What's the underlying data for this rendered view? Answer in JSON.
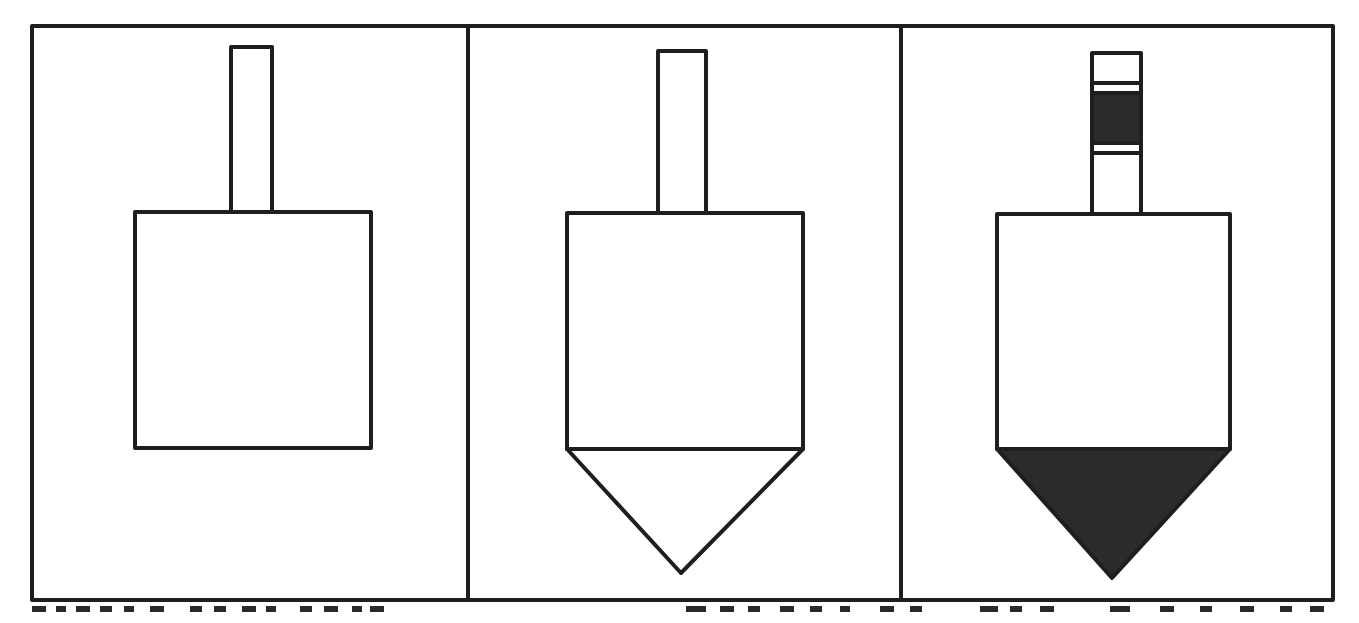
{
  "figure": {
    "title": "",
    "panels": [
      {
        "id": "panel-1",
        "description": "Rectangular body with rod on top",
        "body": {
          "x": 135,
          "y": 212,
          "w": 236,
          "h": 236
        },
        "rod": {
          "x": 231,
          "y": 47,
          "w": 41,
          "h": 165
        },
        "tip": null
      },
      {
        "id": "panel-2",
        "description": "Rectangular body with rod on top and outlined conical tip below",
        "body": {
          "x": 567,
          "y": 213,
          "w": 236,
          "h": 236
        },
        "rod": {
          "x": 658,
          "y": 51,
          "w": 48,
          "h": 162
        },
        "tip": {
          "fill": "none",
          "apex_x": 681,
          "apex_y": 573
        }
      },
      {
        "id": "panel-3",
        "description": "Rectangular body with banded rod on top and filled conical tip below",
        "body": {
          "x": 997,
          "y": 214,
          "w": 233,
          "h": 235
        },
        "rod": {
          "x": 1092,
          "y": 53,
          "w": 49,
          "h": 161,
          "bands": [
            {
              "y": 83,
              "h": 10,
              "fill": "none"
            },
            {
              "y": 93,
              "h": 50,
              "fill": "dark"
            },
            {
              "y": 143,
              "h": 10,
              "fill": "none"
            }
          ]
        },
        "tip": {
          "fill": "dark",
          "apex_x": 1112,
          "apex_y": 578
        }
      }
    ],
    "caption": {
      "visible": "clipped at bottom edge; text not legible"
    }
  },
  "colors": {
    "stroke": "#1e1e1e",
    "fill_dark": "#2b2b2b",
    "background": "#ffffff"
  }
}
